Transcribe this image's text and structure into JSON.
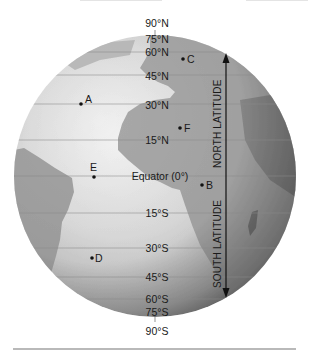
{
  "diagram": {
    "globe": {
      "center": [
        155,
        176
      ],
      "radius": 141,
      "ocean_color": "#e2e2e2",
      "land_color": "#a8a8a8",
      "rim_color": "#5a5a5a"
    },
    "latitude_labels": [
      {
        "text": "90°N",
        "y": 27,
        "line": false
      },
      {
        "text": "75°N",
        "y": 43,
        "line": false
      },
      {
        "text": "60°N",
        "y": 56,
        "line": true,
        "line_y": 52
      },
      {
        "text": "45°N",
        "y": 80,
        "line": true,
        "line_y": 75
      },
      {
        "text": "30°N",
        "y": 109,
        "line": true,
        "line_y": 104
      },
      {
        "text": "15°N",
        "y": 144,
        "line": true,
        "line_y": 140
      },
      {
        "text": "Equator (0°)",
        "y": 180,
        "line": true,
        "line_y": 176
      },
      {
        "text": "15°S",
        "y": 217,
        "line": true,
        "line_y": 213
      },
      {
        "text": "30°S",
        "y": 252,
        "line": true,
        "line_y": 248
      },
      {
        "text": "45°S",
        "y": 281,
        "line": true,
        "line_y": 277
      },
      {
        "text": "60°S",
        "y": 303,
        "line": true,
        "line_y": 299
      },
      {
        "text": "75°S",
        "y": 316,
        "line": false
      },
      {
        "text": "90°S",
        "y": 335,
        "line": false
      }
    ],
    "points": [
      {
        "id": "A",
        "label": "A",
        "x": 81,
        "y": 104
      },
      {
        "id": "B",
        "label": "B",
        "x": 202,
        "y": 185
      },
      {
        "id": "C",
        "label": "C",
        "x": 183,
        "y": 59
      },
      {
        "id": "D",
        "label": "D",
        "x": 92,
        "y": 258
      },
      {
        "id": "E",
        "label": "E",
        "x": 94,
        "y": 177
      },
      {
        "id": "F",
        "label": "F",
        "x": 180,
        "y": 128
      }
    ],
    "arrow": {
      "x": 226,
      "top_y": 53,
      "bottom_y": 298,
      "north_label": "NORTH LATITUDE",
      "south_label": "SOUTH LATITUDE"
    }
  }
}
